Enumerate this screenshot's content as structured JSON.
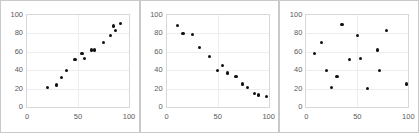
{
  "figure": {
    "panel_count": 3,
    "background_color": "#ffffff",
    "frame_color": "#c9c9c9",
    "marker_color": "#111111",
    "grid_color": "#ededed",
    "tick_label_color": "#5a5a5a"
  },
  "chart_data": [
    {
      "type": "scatter",
      "title": "",
      "xlabel": "",
      "ylabel": "",
      "xlim": [
        0,
        100
      ],
      "ylim": [
        0,
        100
      ],
      "xticks": [
        0,
        50,
        100
      ],
      "yticks": [
        0,
        20,
        40,
        60,
        80,
        100
      ],
      "grid": true,
      "legend": "none",
      "relationship": "positive-correlation",
      "points": [
        {
          "x": 20,
          "y": 21
        },
        {
          "x": 29,
          "y": 24
        },
        {
          "x": 34,
          "y": 32
        },
        {
          "x": 39,
          "y": 40
        },
        {
          "x": 47,
          "y": 52
        },
        {
          "x": 54,
          "y": 58
        },
        {
          "x": 56,
          "y": 53
        },
        {
          "x": 63,
          "y": 62
        },
        {
          "x": 66,
          "y": 62
        },
        {
          "x": 75,
          "y": 70
        },
        {
          "x": 82,
          "y": 78
        },
        {
          "x": 85,
          "y": 88
        },
        {
          "x": 87,
          "y": 83
        },
        {
          "x": 92,
          "y": 91
        }
      ]
    },
    {
      "type": "scatter",
      "title": "",
      "xlabel": "",
      "ylabel": "",
      "xlim": [
        0,
        100
      ],
      "ylim": [
        0,
        100
      ],
      "xticks": [
        0,
        50,
        100
      ],
      "yticks": [
        0,
        20,
        40,
        60,
        80,
        100
      ],
      "grid": true,
      "legend": "none",
      "relationship": "negative-correlation",
      "points": [
        {
          "x": 11,
          "y": 89
        },
        {
          "x": 16,
          "y": 80
        },
        {
          "x": 25,
          "y": 79
        },
        {
          "x": 32,
          "y": 65
        },
        {
          "x": 42,
          "y": 55
        },
        {
          "x": 50,
          "y": 40
        },
        {
          "x": 55,
          "y": 45
        },
        {
          "x": 60,
          "y": 37
        },
        {
          "x": 68,
          "y": 33
        },
        {
          "x": 74,
          "y": 25
        },
        {
          "x": 79,
          "y": 21
        },
        {
          "x": 86,
          "y": 15
        },
        {
          "x": 90,
          "y": 13
        },
        {
          "x": 98,
          "y": 11
        }
      ]
    },
    {
      "type": "scatter",
      "title": "",
      "xlabel": "",
      "ylabel": "",
      "xlim": [
        0,
        100
      ],
      "ylim": [
        0,
        100
      ],
      "xticks": [
        0,
        50,
        100
      ],
      "yticks": [
        0,
        20,
        40,
        60,
        80,
        100
      ],
      "grid": true,
      "legend": "none",
      "relationship": "no-correlation",
      "points": [
        {
          "x": 8,
          "y": 58
        },
        {
          "x": 15,
          "y": 70
        },
        {
          "x": 20,
          "y": 40
        },
        {
          "x": 25,
          "y": 21
        },
        {
          "x": 30,
          "y": 33
        },
        {
          "x": 35,
          "y": 90
        },
        {
          "x": 42,
          "y": 52
        },
        {
          "x": 50,
          "y": 78
        },
        {
          "x": 53,
          "y": 53
        },
        {
          "x": 60,
          "y": 20
        },
        {
          "x": 70,
          "y": 62
        },
        {
          "x": 72,
          "y": 40
        },
        {
          "x": 79,
          "y": 83
        },
        {
          "x": 98,
          "y": 25
        }
      ]
    }
  ]
}
